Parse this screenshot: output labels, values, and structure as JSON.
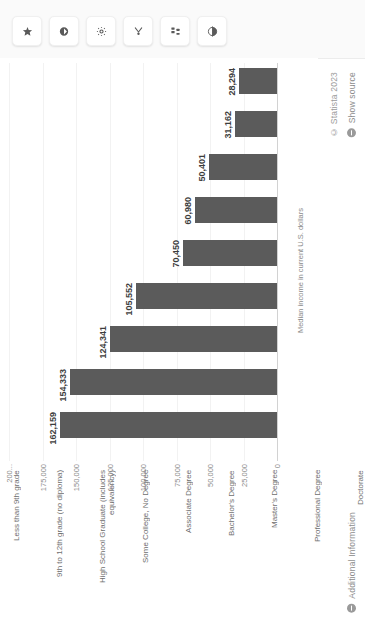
{
  "toolbar": {
    "buttons": [
      {
        "name": "star-icon",
        "label": "Favorite"
      },
      {
        "name": "bookmark-icon",
        "label": "Bookmark"
      },
      {
        "name": "gear-icon",
        "label": "Settings"
      },
      {
        "name": "share-icon",
        "label": "Share"
      },
      {
        "name": "download-icon",
        "label": "Download"
      },
      {
        "name": "contrast-icon",
        "label": "Contrast"
      }
    ]
  },
  "meta": {
    "copyright": "© Statista 2023",
    "show_source": "Show source",
    "additional_information": "Additional Information"
  },
  "chart_data": {
    "type": "bar",
    "orientation": "horizontal",
    "title": "",
    "xlabel": "Median income in current U.S. dollars",
    "ylabel": "",
    "grid": true,
    "legend": null,
    "xlim": [
      0,
      200000
    ],
    "tick_labels": [
      "0",
      "25,000",
      "50,000",
      "75,000",
      "100,000",
      "125,000",
      "150,000",
      "175,000",
      "200..."
    ],
    "tick_values": [
      0,
      25000,
      50000,
      75000,
      100000,
      125000,
      150000,
      175000,
      200000
    ],
    "categories": [
      "Less than 9th grade",
      "9th to 12th grade (no diploma)",
      "High School Graduate (includes\nequivalency)",
      "Some College, No Degree",
      "Associate Degree",
      "Bachelor's Degree",
      "Master's Degree",
      "Professional Degree",
      "Doctorate"
    ],
    "values": [
      28294,
      31162,
      50401,
      60980,
      70450,
      105552,
      124341,
      154333,
      162159
    ],
    "value_labels": [
      "28,294",
      "31,162",
      "50,401",
      "60,980",
      "70,450",
      "105,552",
      "124,341",
      "154,333",
      "162,159"
    ],
    "bar_color": "#5b5b5b"
  }
}
